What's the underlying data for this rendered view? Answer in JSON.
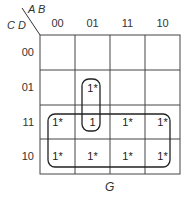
{
  "kmap": {
    "row_var_label": "C D",
    "col_var_label": "A B",
    "col_headers": [
      "00",
      "01",
      "11",
      "10"
    ],
    "row_headers": [
      "00",
      "01",
      "11",
      "10"
    ],
    "cells": [
      [
        "",
        "",
        "",
        ""
      ],
      [
        "",
        "1*",
        "",
        ""
      ],
      [
        "1*",
        "1",
        "1*",
        "1*"
      ],
      [
        "1*",
        "1*",
        "1*",
        "1*"
      ]
    ],
    "groups": [
      {
        "name": "vertical-pair",
        "cells": "col 01, rows 01-11"
      },
      {
        "name": "bottom-octet",
        "cells": "rows 11-10, all cols"
      }
    ],
    "caption": "G"
  }
}
